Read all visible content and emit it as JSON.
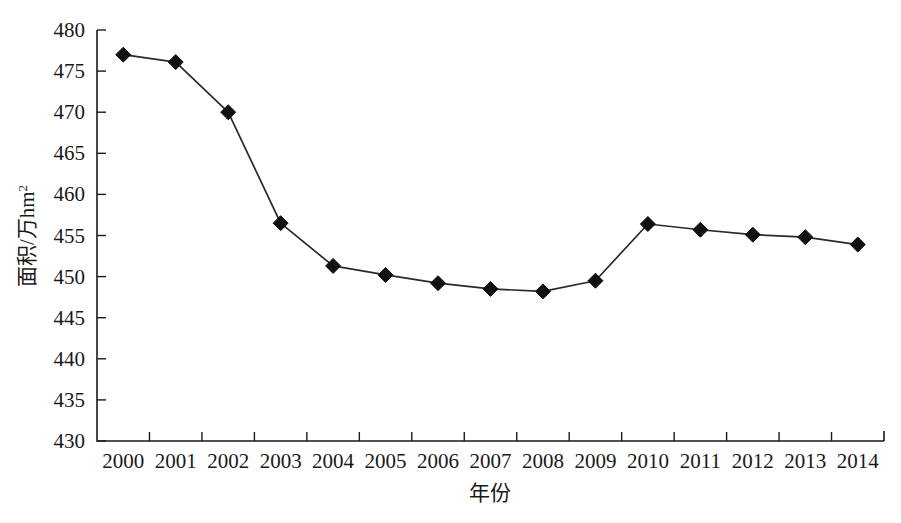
{
  "chart_data": {
    "type": "line",
    "title": "",
    "xlabel": "年份",
    "ylabel": "面积/万hm",
    "ylabel_superscript": "2",
    "categories": [
      "2000",
      "2001",
      "2002",
      "2003",
      "2004",
      "2005",
      "2006",
      "2007",
      "2008",
      "2009",
      "2010",
      "2011",
      "2012",
      "2013",
      "2014"
    ],
    "series": [
      {
        "name": "面积",
        "values": [
          477.0,
          476.1,
          470.0,
          456.5,
          451.3,
          450.2,
          449.2,
          448.5,
          448.2,
          449.5,
          456.4,
          455.7,
          455.1,
          454.8,
          453.9
        ],
        "marker": "filled-diamond",
        "color": "#111111"
      }
    ],
    "ylim": [
      430,
      480
    ],
    "ytick_values": [
      430,
      435,
      440,
      445,
      450,
      455,
      460,
      465,
      470,
      475,
      480
    ],
    "ytick_labels": [
      "430",
      "435",
      "440",
      "445",
      "450",
      "455",
      "460",
      "465",
      "470",
      "475",
      "480"
    ],
    "xtick_labels": [
      "2000",
      "2001",
      "2002",
      "2003",
      "2004",
      "2005",
      "2006",
      "2007",
      "2008",
      "2009",
      "2010",
      "2011",
      "2012",
      "2013",
      "2014"
    ],
    "grid": false,
    "legend": null,
    "legend_position": "none",
    "axis_color": "#1a1a1a",
    "background_color": "#ffffff"
  }
}
